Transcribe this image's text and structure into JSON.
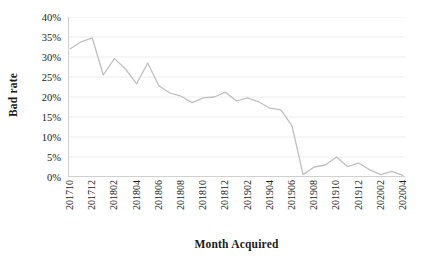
{
  "chart_data": {
    "type": "line",
    "title": "",
    "xlabel": "Month Acquired",
    "ylabel": "Bad rate",
    "ylim": [
      0,
      40
    ],
    "ytick_labels": [
      "40%",
      "35%",
      "30%",
      "25%",
      "20%",
      "15%",
      "10%",
      "5%",
      "0%"
    ],
    "ytick_values": [
      40,
      35,
      30,
      25,
      20,
      15,
      10,
      5,
      0
    ],
    "grid": true,
    "legend": false,
    "line_color": "#bfbfbf",
    "x": [
      "201710",
      "201711",
      "201712",
      "201801",
      "201802",
      "201803",
      "201804",
      "201805",
      "201806",
      "201807",
      "201808",
      "201809",
      "201810",
      "201811",
      "201812",
      "201901",
      "201902",
      "201903",
      "201904",
      "201905",
      "201906",
      "201907",
      "201908",
      "201909",
      "201910",
      "201911",
      "201912",
      "202001",
      "202002",
      "202003",
      "202004"
    ],
    "xtick_labels": [
      "201710",
      "201712",
      "201802",
      "201804",
      "201806",
      "201808",
      "201810",
      "201812",
      "201902",
      "201904",
      "201906",
      "201908",
      "201910",
      "201912",
      "202002",
      "202004"
    ],
    "xtick_indices": [
      0,
      2,
      4,
      6,
      8,
      10,
      12,
      14,
      16,
      18,
      20,
      22,
      24,
      26,
      28,
      30
    ],
    "values": [
      32.0,
      33.8,
      34.8,
      25.5,
      29.6,
      27.0,
      23.3,
      28.5,
      22.8,
      21.0,
      20.2,
      18.6,
      19.8,
      20.0,
      21.2,
      19.0,
      19.8,
      18.8,
      17.2,
      16.8,
      12.8,
      0.6,
      2.5,
      3.0,
      5.0,
      2.6,
      3.5,
      1.8,
      0.6,
      1.4,
      0.4
    ],
    "series_name": "Bad rate"
  }
}
